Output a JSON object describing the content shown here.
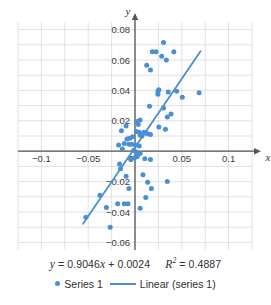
{
  "chart_data": {
    "type": "scatter",
    "title": "",
    "xlabel": "x",
    "ylabel": "y",
    "xlim": [
      -0.125,
      0.125
    ],
    "ylim": [
      -0.065,
      0.085
    ],
    "grid": true,
    "x_ticks": [
      -0.1,
      -0.05,
      0.05,
      0.1
    ],
    "x_tick_labels": [
      "−0.1",
      "−0.05",
      "0.05",
      "0.1"
    ],
    "y_ticks": [
      0.08,
      0.06,
      0.04,
      0.02,
      -0.02,
      -0.04,
      -0.06
    ],
    "y_tick_labels": [
      "0.08",
      "0.06",
      "0.04",
      "0.02",
      "−0.02",
      "−0.04",
      "−0.06"
    ],
    "origin_label": "0",
    "x_minor_step": 0.025,
    "y_minor_step": 0.01,
    "marker_color": "#4a8fd4",
    "line_color": "#4a8fd4",
    "grid_color": "#d9d9d9",
    "axis_color": "#555555",
    "series": [
      {
        "name": "Series 1",
        "type": "scatter",
        "points": [
          [
            0.0305,
            0.0715
          ],
          [
            0.0185,
            0.0655
          ],
          [
            0.0225,
            0.0655
          ],
          [
            0.0415,
            0.0655
          ],
          [
            0.0165,
            0.0535
          ],
          [
            0.0335,
            0.06
          ],
          [
            0.0285,
            0.0625
          ],
          [
            0.0125,
            0.0565
          ],
          [
            0.0255,
            0.0405
          ],
          [
            0.0245,
            0.0395
          ],
          [
            0.0245,
            0.0375
          ],
          [
            0.0355,
            0.039
          ],
          [
            0.0445,
            0.0395
          ],
          [
            0.0505,
            0.0355
          ],
          [
            0.0685,
            0.0385
          ],
          [
            0.0305,
            0.0285
          ],
          [
            0.0155,
            0.0295
          ],
          [
            0.0385,
            0.0245
          ],
          [
            0.0345,
            0.0225
          ],
          [
            0.0055,
            0.0205
          ],
          [
            0.0025,
            0.0195
          ],
          [
            0.0035,
            0.0175
          ],
          [
            0.0255,
            0.016
          ],
          [
            0.0325,
            0.0145
          ],
          [
            -0.0095,
            0.0165
          ],
          [
            -0.0145,
            0.0135
          ],
          [
            0.0015,
            0.013
          ],
          [
            0.0045,
            0.0125
          ],
          [
            0.0095,
            0.0125
          ],
          [
            0.0115,
            0.012
          ],
          [
            0.0135,
            0.0115
          ],
          [
            0.0165,
            0.011
          ],
          [
            0.0055,
            0.0105
          ],
          [
            0.0075,
            0.01
          ],
          [
            -0.0025,
            0.0095
          ],
          [
            -0.0055,
            0.0085
          ],
          [
            -0.0085,
            0.008
          ],
          [
            -0.0115,
            0.005
          ],
          [
            -0.0065,
            0.0045
          ],
          [
            -0.0035,
            0.0045
          ],
          [
            0.0005,
            0.004
          ],
          [
            0.0045,
            0.0035
          ],
          [
            -0.0175,
            0.004
          ],
          [
            -0.0135,
            0.0015
          ],
          [
            -0.0015,
            0.0005
          ],
          [
            0.0015,
            -0.0005
          ],
          [
            0.0055,
            -0.0015
          ],
          [
            0.0025,
            -0.0035
          ],
          [
            -0.0005,
            -0.0045
          ],
          [
            -0.0045,
            -0.0055
          ],
          [
            0.0105,
            -0.005
          ],
          [
            0.0165,
            -0.0055
          ],
          [
            -0.0165,
            -0.0085
          ],
          [
            -0.0155,
            -0.0115
          ],
          [
            -0.0095,
            -0.0165
          ],
          [
            0.0085,
            -0.0155
          ],
          [
            0.0135,
            -0.0205
          ],
          [
            0.0345,
            -0.02
          ],
          [
            -0.0065,
            -0.0245
          ],
          [
            0.0175,
            -0.0245
          ],
          [
            0.0115,
            -0.0305
          ],
          [
            -0.0185,
            -0.0345
          ],
          [
            -0.0115,
            -0.0345
          ],
          [
            -0.0075,
            -0.0345
          ],
          [
            0.0055,
            -0.0375
          ],
          [
            -0.0525,
            -0.0435
          ],
          [
            -0.0305,
            -0.037
          ],
          [
            -0.0375,
            -0.029
          ],
          [
            -0.0265,
            -0.05
          ]
        ]
      },
      {
        "name": "Linear (series 1)",
        "type": "line",
        "equation": "y = 0.9046x + 0.0024",
        "slope": 0.9046,
        "intercept": 0.0024,
        "r_squared": 0.4887,
        "x_start": -0.0555,
        "x_end": 0.07
      }
    ],
    "annotations": {
      "equation_y": "y",
      "equation_eq": "=",
      "equation_body": "0.9046",
      "equation_x": "x",
      "equation_plus": "+ 0.0024",
      "r_symbol": "R",
      "r_exponent": "2",
      "r_eq": "=",
      "r_value": "0.4887"
    },
    "legend": {
      "position": "bottom",
      "entries": [
        {
          "label": "Series 1",
          "marker": "dot",
          "color": "#4a8fd4"
        },
        {
          "label": "Linear (series 1)",
          "marker": "line",
          "color": "#4a8fd4"
        }
      ]
    }
  }
}
